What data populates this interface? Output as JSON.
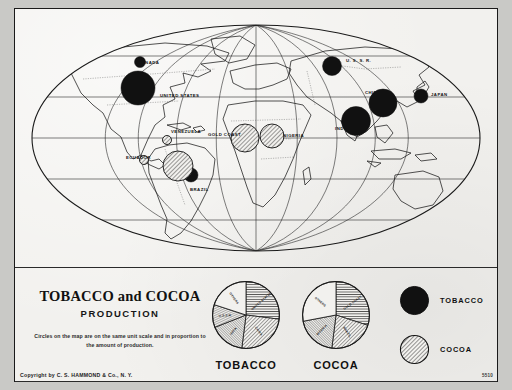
{
  "plate": {
    "title_line": "TOBACCO and COCOA",
    "subtitle": "PRODUCTION",
    "note": "Circles on the map are on the same unit scale and in proportion to the amount of production.",
    "copyright": "Copyright by C. S. HAMMOND & Co., N. Y.",
    "plate_code": "5510",
    "colors": {
      "tobacco_fill": "#111111",
      "cocoa_fill": "#f2f1ee",
      "cocoa_hatch": "#1a1a1a",
      "paper": "#f2f1ee",
      "backing": "#c9c9c6",
      "ink": "#1a1a1a"
    }
  },
  "legend": {
    "items": [
      {
        "label": "TOBACCO",
        "symbol": "solid-black-circle"
      },
      {
        "label": "COCOA",
        "symbol": "hatched-circle"
      }
    ]
  },
  "map": {
    "projection": "oval world projection",
    "country_labels": [
      {
        "name": "CANADA",
        "x": 123,
        "y": 55
      },
      {
        "name": "UNITED STATES",
        "x": 145,
        "y": 88
      },
      {
        "name": "VENEZUELA",
        "x": 156,
        "y": 124
      },
      {
        "name": "ECUADOR",
        "x": 111,
        "y": 150
      },
      {
        "name": "BRAZIL",
        "x": 175,
        "y": 182
      },
      {
        "name": "GOLD COAST",
        "x": 193,
        "y": 127
      },
      {
        "name": "NIGERIA",
        "x": 268,
        "y": 128
      },
      {
        "name": "U. S. S. R.",
        "x": 331,
        "y": 53
      },
      {
        "name": "CHINA",
        "x": 350,
        "y": 85
      },
      {
        "name": "JAPAN",
        "x": 416,
        "y": 87
      },
      {
        "name": "INDIA",
        "x": 320,
        "y": 121
      }
    ],
    "symbols": [
      {
        "country": "CANADA",
        "type": "tobacco",
        "cx": 125,
        "cy": 53,
        "r": 5.5
      },
      {
        "country": "UNITED STATES",
        "type": "tobacco",
        "cx": 123,
        "cy": 79,
        "r": 17
      },
      {
        "country": "BRAZIL",
        "type": "tobacco",
        "cx": 176,
        "cy": 166,
        "r": 7
      },
      {
        "country": "U. S. S. R.",
        "type": "tobacco",
        "cx": 317,
        "cy": 57,
        "r": 9.5
      },
      {
        "country": "CHINA",
        "type": "tobacco",
        "cx": 368,
        "cy": 94,
        "r": 14
      },
      {
        "country": "JAPAN",
        "type": "tobacco",
        "cx": 406,
        "cy": 87,
        "r": 7
      },
      {
        "country": "INDIA",
        "type": "tobacco",
        "cx": 341,
        "cy": 112,
        "r": 14.5
      },
      {
        "country": "VENEZUELA",
        "type": "cocoa",
        "cx": 152,
        "cy": 131,
        "r": 4.5
      },
      {
        "country": "ECUADOR",
        "type": "cocoa",
        "cx": 129,
        "cy": 151,
        "r": 4.5
      },
      {
        "country": "BRAZIL",
        "type": "cocoa",
        "cx": 163,
        "cy": 157,
        "r": 15
      },
      {
        "country": "GOLD COAST",
        "type": "cocoa",
        "cx": 230,
        "cy": 129,
        "r": 14
      },
      {
        "country": "NIGERIA",
        "type": "cocoa",
        "cx": 257,
        "cy": 127,
        "r": 12
      }
    ]
  },
  "chart_data": [
    {
      "type": "pie",
      "title": "TOBACCO",
      "unit": "share of world production",
      "slices": [
        {
          "label": "UNITED STATES",
          "value": 27,
          "fill": "horizontal-hatch"
        },
        {
          "label": "CHINA",
          "value": 25,
          "fill": "diagonal-hatch"
        },
        {
          "label": "INDIA",
          "value": 17,
          "fill": "diagonal-hatch-dense"
        },
        {
          "label": "U.S.S.R.",
          "value": 11,
          "fill": "fine-hatch"
        },
        {
          "label": "OTHERS",
          "value": 20,
          "fill": "plain"
        }
      ]
    },
    {
      "type": "pie",
      "title": "COCOA",
      "unit": "share of world production",
      "slices": [
        {
          "label": "GOLD COAST",
          "value": 30,
          "fill": "horizontal-hatch"
        },
        {
          "label": "BRAZIL",
          "value": 22,
          "fill": "diagonal-hatch"
        },
        {
          "label": "NIGERIA",
          "value": 20,
          "fill": "diagonal-hatch-dense"
        },
        {
          "label": "OTHERS",
          "value": 28,
          "fill": "plain"
        }
      ]
    }
  ]
}
